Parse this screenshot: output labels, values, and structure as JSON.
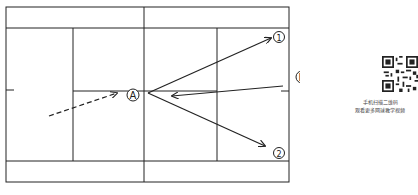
{
  "diagram": {
    "court": {
      "line_color": "#222222",
      "outer": {
        "x1": 6,
        "y1": 7,
        "x2": 289,
        "y2": 182
      },
      "alley_top_y": 28,
      "alley_bottom_y": 161,
      "net_x": 144,
      "service_left_x": 73,
      "service_right_x": 217,
      "center_line_y": 91
    },
    "players": [
      {
        "id": "A",
        "label": "A",
        "x": 133,
        "y": 95
      },
      {
        "id": "B",
        "label": "B",
        "x": 302,
        "y": 77
      }
    ],
    "targets": [
      {
        "id": "1",
        "label": "①",
        "x": 279,
        "y": 37
      },
      {
        "id": "2",
        "label": "②",
        "x": 279,
        "y": 153
      }
    ],
    "paths": [
      {
        "name": "approach-dashed",
        "style": "dashed",
        "from": [
          49,
          116
        ],
        "to": [
          117,
          93
        ]
      },
      {
        "name": "shot-b-to-a",
        "style": "solid",
        "from": [
          283,
          86
        ],
        "to": [
          172,
          96
        ]
      },
      {
        "name": "shot-a-to-1",
        "style": "solid",
        "from": [
          148,
          93
        ],
        "to": [
          271,
          38
        ]
      },
      {
        "name": "shot-a-to-2",
        "style": "solid",
        "from": [
          148,
          93
        ],
        "to": [
          265,
          146
        ]
      }
    ]
  },
  "qr": {
    "caption_line1": "手机扫描二维码",
    "caption_line2": "观看更多网球教学视频"
  }
}
